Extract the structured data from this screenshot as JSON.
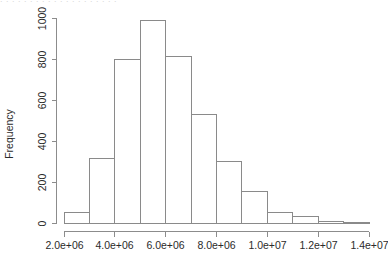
{
  "top_clipped_text": ". . . . . . . . . . . . . . . . . . . .",
  "chart_data": {
    "type": "bar",
    "subtype": "histogram",
    "title": "",
    "xlabel": "",
    "ylabel": "Frequency",
    "xlim": [
      2000000,
      14000000
    ],
    "ylim": [
      0,
      1000
    ],
    "grid": false,
    "legend": null,
    "x_tick_labels": [
      "2.0e+06",
      "4.0e+06",
      "6.0e+06",
      "8.0e+06",
      "1.0e+07",
      "1.2e+07",
      "1.4e+07"
    ],
    "x_tick_values": [
      2000000,
      4000000,
      6000000,
      8000000,
      10000000,
      12000000,
      14000000
    ],
    "y_tick_labels": [
      "0",
      "200",
      "400",
      "600",
      "800",
      "1000"
    ],
    "y_tick_values": [
      0,
      200,
      400,
      600,
      800,
      1000
    ],
    "bin_width": 1000000,
    "bin_edges": [
      2000000,
      3000000,
      4000000,
      5000000,
      6000000,
      7000000,
      8000000,
      9000000,
      10000000,
      11000000,
      12000000,
      13000000,
      14000000
    ],
    "categories": [
      "2-3e+06",
      "3-4e+06",
      "4-5e+06",
      "5-6e+06",
      "6-7e+06",
      "7-8e+06",
      "8-9e+06",
      "9-10e+06",
      "10-11e+06",
      "11-12e+06",
      "12-13e+06",
      "13-14e+06"
    ],
    "values": [
      50,
      313,
      798,
      990,
      810,
      528,
      300,
      155,
      50,
      30,
      5,
      2
    ]
  }
}
